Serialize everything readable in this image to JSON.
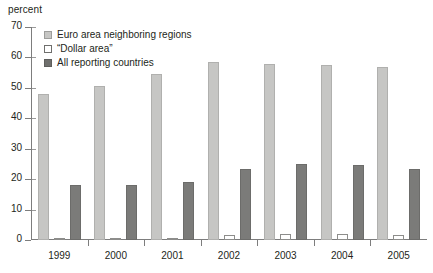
{
  "chart_data": {
    "type": "bar",
    "title": "",
    "subtitle": "",
    "xlabel": "",
    "ylabel": "percent",
    "unit_label": "percent",
    "categories": [
      "1999",
      "2000",
      "2001",
      "2002",
      "2003",
      "2004",
      "2005"
    ],
    "series": [
      {
        "name": "Euro area neighboring regions",
        "color": "#c6c6c4",
        "values": [
          48.0,
          50.5,
          54.5,
          58.5,
          58.0,
          57.5,
          57.0
        ]
      },
      {
        "name": "“Dollar area”",
        "color": "#ffffff",
        "values": [
          0.4,
          0.4,
          0.5,
          1.5,
          2.0,
          2.0,
          1.8
        ]
      },
      {
        "name": "All reporting countries",
        "color": "#7b7b79",
        "values": [
          18.0,
          18.0,
          19.0,
          23.5,
          25.0,
          24.5,
          23.5
        ]
      }
    ],
    "ylim": [
      0,
      70
    ],
    "ytick_step": 10,
    "yticks": [
      70,
      60,
      50,
      40,
      30,
      20,
      10,
      0
    ],
    "grid": false,
    "legend_position": "top-left"
  },
  "legend": {
    "entries": [
      {
        "label": "Euro area neighboring regions"
      },
      {
        "label": "“Dollar area”"
      },
      {
        "label": "All reporting countries"
      }
    ]
  },
  "axis": {
    "unit": "percent"
  }
}
